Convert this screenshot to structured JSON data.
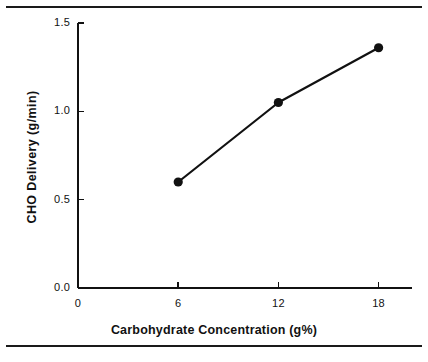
{
  "figure": {
    "background": "#ffffff",
    "ink": "#111111",
    "rules": {
      "top_label": "top-horizontal-rule",
      "bottom_label": "bottom-horizontal-rule"
    }
  },
  "chart_data": {
    "type": "line",
    "title": "",
    "subtitle": "",
    "xlabel": "Carbohydrate Concentration (g%)",
    "ylabel": "CHO  Delivery  (g/min)",
    "x": [
      6,
      12,
      18
    ],
    "values": [
      0.6,
      1.05,
      1.36
    ],
    "series": [
      {
        "name": "CHO Delivery",
        "x": [
          6,
          12,
          18
        ],
        "values": [
          0.6,
          1.05,
          1.36
        ],
        "marker": "filled-circle",
        "color": "#111111"
      }
    ],
    "xlim": [
      0,
      20
    ],
    "ylim": [
      0.0,
      1.5
    ],
    "xticks": [
      0,
      6,
      12,
      18
    ],
    "xtick_labels": [
      "0",
      "6",
      "12",
      "18"
    ],
    "yticks": [
      0.0,
      0.5,
      1.0,
      1.5
    ],
    "ytick_labels": [
      "0.0",
      "0.5",
      "1.0",
      "1.5"
    ],
    "grid": false,
    "legend": "none",
    "tick_direction": "in",
    "annotations": []
  }
}
